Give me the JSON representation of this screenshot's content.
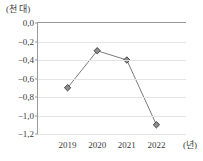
{
  "chart_data": {
    "type": "line",
    "title": "",
    "subtitle": "",
    "xlabel": "(년)",
    "ylabel": "(천 대)",
    "categories": [
      "2019",
      "2020",
      "2021",
      "2022"
    ],
    "values": [
      -0.7,
      -0.3,
      -0.4,
      -1.1
    ],
    "series": [
      {
        "name": "",
        "values": [
          -0.7,
          -0.3,
          -0.4,
          -1.1
        ]
      }
    ],
    "ylim": [
      -1.2,
      0.0
    ],
    "y_ticks": [
      0.0,
      -0.2,
      -0.4,
      -0.6,
      -0.8,
      -1.0,
      -1.2
    ],
    "y_tick_labels": [
      "0,0",
      "−0,2",
      "−0,4",
      "−0,6",
      "−0,8",
      "−1,0",
      "−1,2"
    ],
    "x_tick_labels": [
      "2019",
      "2020",
      "2021",
      "2022"
    ],
    "grid": true,
    "legend": "none",
    "marker": "diamond",
    "decimal_separator": ",",
    "colors": {
      "line": "#7a7a7a",
      "marker_fill": "#8c8c8c",
      "marker_stroke": "#4a4a4a",
      "grid": "#e4e4e4",
      "axis": "#9a9a9a",
      "text": "#3b3b3b",
      "background": "#ffffff"
    }
  }
}
